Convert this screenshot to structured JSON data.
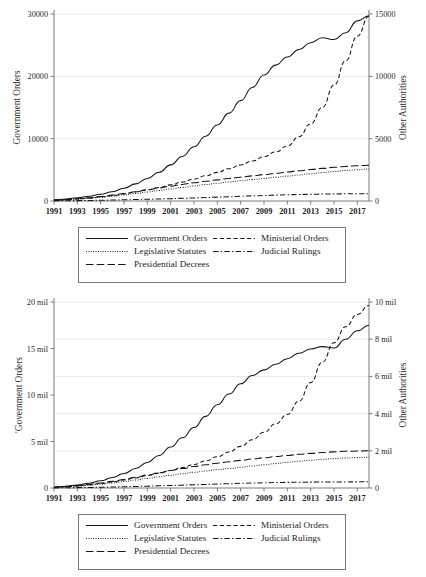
{
  "figure": {
    "panels": [
      {
        "id": "top",
        "left_axis_title": "Government Orders",
        "right_axis_title": "Other Authorities",
        "left_ticks": [
          "0",
          "10000",
          "20000",
          "30000"
        ],
        "right_ticks": [
          "0",
          "5000",
          "10000",
          "15000"
        ],
        "x_ticks": [
          "1991",
          "1993",
          "1995",
          "1997",
          "1999",
          "2001",
          "2003",
          "2005",
          "2007",
          "2009",
          "2011",
          "2013",
          "2015",
          "2017"
        ]
      },
      {
        "id": "bottom",
        "left_axis_title": "'Government Orders",
        "right_axis_title": "Other Authorities",
        "left_ticks": [
          "0",
          "5 mil",
          "10 mil",
          "15 mil",
          "20 mil"
        ],
        "right_ticks": [
          "0",
          "2 mil",
          "4 mil",
          "6 mil",
          "8 mil",
          "10 mil"
        ],
        "x_ticks": [
          "1991",
          "1993",
          "1995",
          "1997",
          "1999",
          "2001",
          "2003",
          "2005",
          "2007",
          "2009",
          "2011",
          "2013",
          "2015",
          "2017"
        ]
      }
    ],
    "legend": {
      "items": [
        {
          "label": "Government Orders",
          "style": "solid",
          "swatch": "s-solid"
        },
        {
          "label": "Ministerial Orders",
          "style": "dash",
          "swatch": "s-dash"
        },
        {
          "label": "Legislative Statutes",
          "style": "dot",
          "swatch": "s-dot"
        },
        {
          "label": "Judicial Rulings",
          "style": "dashdot",
          "swatch": "s-dashdot"
        },
        {
          "label": "Presidential Decrees",
          "style": "longdash",
          "swatch": "s-longdash"
        }
      ]
    },
    "colors": {
      "line": "#171717",
      "axis": "#6e6e6e",
      "grid": "#e3e3e3",
      "background": "#ffffff"
    }
  },
  "chart_data": [
    {
      "type": "line",
      "panel": "top",
      "title": "",
      "xlabel": "",
      "ylabel": "Government Orders",
      "y2label": "Other Authorities",
      "xlim": [
        1991,
        2018
      ],
      "ylim": [
        0,
        30000
      ],
      "y2lim": [
        0,
        16000
      ],
      "grid": "horizontal",
      "legend_position": "below",
      "x": [
        1991,
        1992,
        1993,
        1994,
        1995,
        1996,
        1997,
        1998,
        1999,
        2000,
        2001,
        2002,
        2003,
        2004,
        2005,
        2006,
        2007,
        2008,
        2009,
        2010,
        2011,
        2012,
        2013,
        2014,
        2015,
        2016,
        2017,
        2018
      ],
      "series": [
        {
          "name": "Government Orders",
          "axis": "left",
          "style": "solid",
          "values": [
            180,
            330,
            520,
            760,
            1080,
            1500,
            2050,
            2750,
            3600,
            4600,
            5800,
            7150,
            8700,
            10400,
            12200,
            14100,
            16100,
            18200,
            20200,
            21800,
            23100,
            24300,
            25400,
            26200,
            25900,
            27000,
            28900,
            29700
          ]
        },
        {
          "name": "Ministerial Orders",
          "axis": "right",
          "style": "dash",
          "values": [
            60,
            110,
            170,
            250,
            350,
            470,
            610,
            780,
            960,
            1160,
            1380,
            1620,
            1880,
            2160,
            2450,
            2760,
            3080,
            3420,
            3790,
            4200,
            4700,
            5500,
            6600,
            8000,
            9900,
            12000,
            14100,
            15800
          ]
        },
        {
          "name": "Legislative Statutes",
          "axis": "right",
          "style": "dot",
          "values": [
            55,
            100,
            155,
            225,
            310,
            410,
            520,
            640,
            770,
            900,
            1030,
            1160,
            1290,
            1410,
            1520,
            1630,
            1730,
            1830,
            1930,
            2030,
            2130,
            2230,
            2330,
            2430,
            2520,
            2610,
            2680,
            2740
          ]
        },
        {
          "name": "Judicial Rulings",
          "axis": "right",
          "style": "dashdot",
          "values": [
            10,
            20,
            32,
            46,
            62,
            80,
            100,
            122,
            146,
            172,
            200,
            230,
            262,
            295,
            330,
            366,
            402,
            438,
            472,
            504,
            532,
            556,
            576,
            592,
            604,
            614,
            622,
            628
          ]
        },
        {
          "name": "Presidential Decrees",
          "axis": "right",
          "style": "longdash",
          "values": [
            70,
            125,
            195,
            280,
            385,
            505,
            640,
            790,
            950,
            1110,
            1270,
            1420,
            1560,
            1690,
            1810,
            1930,
            2040,
            2150,
            2260,
            2370,
            2480,
            2590,
            2690,
            2790,
            2880,
            2960,
            3020,
            3060
          ]
        }
      ]
    },
    {
      "type": "line",
      "panel": "bottom",
      "title": "",
      "xlabel": "",
      "ylabel": "'Government Orders",
      "y2label": "Other Authorities",
      "xlim": [
        1991,
        2018
      ],
      "ylim": [
        0,
        20000000
      ],
      "y2lim": [
        0,
        10500000
      ],
      "grid": "horizontal",
      "legend_position": "below",
      "x": [
        1991,
        1992,
        1993,
        1994,
        1995,
        1996,
        1997,
        1998,
        1999,
        2000,
        2001,
        2002,
        2003,
        2004,
        2005,
        2006,
        2007,
        2008,
        2009,
        2010,
        2011,
        2012,
        2013,
        2014,
        2015,
        2016,
        2017,
        2018
      ],
      "series": [
        {
          "name": "Government Orders",
          "axis": "left",
          "style": "solid",
          "values": [
            90000,
            190000,
            330000,
            520000,
            780000,
            1120000,
            1560000,
            2100000,
            2750000,
            3500000,
            4400000,
            5400000,
            6500000,
            7700000,
            8950000,
            10100000,
            11200000,
            12100000,
            12700000,
            13300000,
            13900000,
            14500000,
            14950000,
            15200000,
            15050000,
            16000000,
            16900000,
            17500000
          ]
        },
        {
          "name": "Ministerial Orders",
          "axis": "right",
          "style": "dash",
          "values": [
            40000,
            75000,
            120000,
            180000,
            255000,
            345000,
            450000,
            570000,
            700000,
            840000,
            990000,
            1150000,
            1330000,
            1530000,
            1760000,
            2030000,
            2350000,
            2720000,
            3150000,
            3620000,
            4150000,
            4900000,
            5950000,
            7100000,
            8200000,
            9100000,
            9800000,
            10300000
          ]
        },
        {
          "name": "Legislative Statutes",
          "axis": "right",
          "style": "dot",
          "values": [
            35000,
            65000,
            105000,
            155000,
            215000,
            285000,
            365000,
            450000,
            540000,
            630000,
            720000,
            805000,
            885000,
            960000,
            1030000,
            1100000,
            1170000,
            1240000,
            1310000,
            1380000,
            1450000,
            1510000,
            1570000,
            1620000,
            1660000,
            1690000,
            1715000,
            1730000
          ]
        },
        {
          "name": "Judicial Rulings",
          "axis": "right",
          "style": "dashdot",
          "values": [
            6000,
            13000,
            21000,
            31000,
            43000,
            56000,
            71000,
            87000,
            104000,
            122000,
            141000,
            161000,
            182000,
            203000,
            224000,
            244000,
            263000,
            280000,
            295000,
            308000,
            318000,
            326000,
            332000,
            337000,
            341000,
            344000,
            347000,
            349000
          ]
        },
        {
          "name": "Presidential Decrees",
          "axis": "right",
          "style": "longdash",
          "values": [
            45000,
            85000,
            135000,
            200000,
            280000,
            375000,
            485000,
            605000,
            730000,
            860000,
            985000,
            1100000,
            1210000,
            1310000,
            1400000,
            1485000,
            1560000,
            1635000,
            1705000,
            1775000,
            1840000,
            1900000,
            1955000,
            2000000,
            2040000,
            2070000,
            2090000,
            2100000
          ]
        }
      ]
    }
  ]
}
